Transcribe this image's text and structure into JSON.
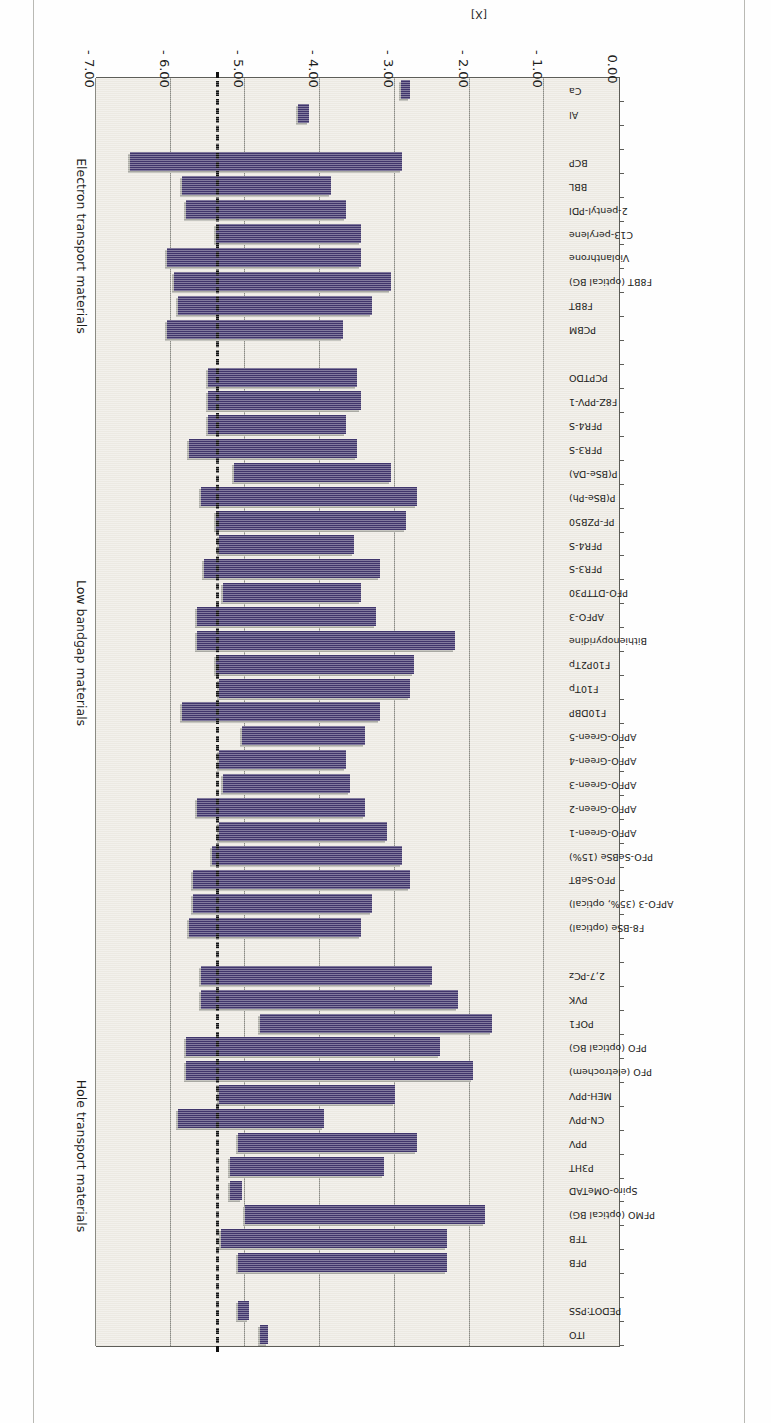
{
  "figure": {
    "axis_title": "[X]",
    "bar_color": "#40356b",
    "shadow_color": "#a9a9a2",
    "plot_background": "#ece9e2",
    "reference_line_value": -5.35,
    "reference_line_color": "#111111"
  },
  "groups": [
    {
      "label": "Hole transport materials"
    },
    {
      "label": "Low bandgap materials"
    },
    {
      "label": "Electron transport materials"
    }
  ],
  "chart_data": {
    "type": "bar",
    "orientation": "horizontal-range",
    "title": "",
    "xlabel": "[X]",
    "ylabel": "",
    "xlim": [
      0.0,
      -7.0
    ],
    "grid": true,
    "legend_position": "none",
    "tick_labels": [
      "0.00",
      "- 1.00",
      "- 2.00",
      "- 3.00",
      "- 4.00",
      "- 5.00",
      "- 6.00",
      "- 7.00"
    ],
    "tick_values": [
      0.0,
      -1.0,
      -2.0,
      -3.0,
      -4.0,
      -5.0,
      -6.0,
      -7.0
    ],
    "annotations": [
      {
        "text": "Hole transport materials",
        "kind": "group-label"
      },
      {
        "text": "Low bandgap materials",
        "kind": "group-label"
      },
      {
        "text": "Electron transport materials",
        "kind": "group-label"
      }
    ],
    "reference_lines": [
      {
        "value": -5.35,
        "style": "dash-dot",
        "color": "#111111"
      }
    ],
    "categories": [
      "ITO",
      "PEDOT:PSS",
      "",
      "PFB",
      "TFB",
      "PFMO (optical BG)",
      "Spiro-OMeTAD",
      "P3HT",
      "PPV",
      "CN-PPV",
      "MEH-PPV",
      "PFO (eletrochem)",
      "PFO (optical BG)",
      "POF1",
      "PVK",
      "2,7-PCz",
      "",
      "F8-BSe (optical)",
      "APFO-3 (35%, optical)",
      "PFO-SeBT",
      "PFO-SeBSe (15%)",
      "APFO-Green-1",
      "APFO-Green-2",
      "APFO-Green-3",
      "APFO-Green-4",
      "APFO-Green-5",
      "F10DBP",
      "F10Tp",
      "F10P2Tp",
      "Bithienopyridine",
      "APFO-3",
      "PFO-DTTP30",
      "PFR3-S",
      "PFR4-S",
      "PF-PZB50",
      "P(BSe-Ph)",
      "P(BSe-DA)",
      "PFR3-S",
      "PFR4-S",
      "F8Z-PPV-1",
      "PCPTDO",
      "",
      "PCBM",
      "F8BT",
      "F8BT (optical BG)",
      "Violanthrone",
      "C13-perylene",
      "2-pentyl-PDI",
      "BBL",
      "BCP",
      "",
      "Al",
      "Ca"
    ],
    "series": [
      {
        "name": "HOMO-LUMO range (eV)",
        "note": "each bar spans from the shallower level (HOMO/LUMO) to the deeper level",
        "ranges": [
          {
            "category": "ITO",
            "start": -4.7,
            "end": -4.8,
            "group": "Hole transport materials"
          },
          {
            "category": "PEDOT:PSS",
            "start": -4.95,
            "end": -5.1,
            "group": "Hole transport materials"
          },
          {
            "category": "PFB",
            "start": -2.3,
            "end": -5.1,
            "group": "Hole transport materials"
          },
          {
            "category": "TFB",
            "start": -2.3,
            "end": -5.33,
            "group": "Hole transport materials"
          },
          {
            "category": "PFMO (optical BG)",
            "start": -1.8,
            "end": -5.0,
            "group": "Hole transport materials"
          },
          {
            "category": "Spiro-OMeTAD",
            "start": -5.05,
            "end": -5.2,
            "group": "Hole transport materials"
          },
          {
            "category": "P3HT",
            "start": -3.15,
            "end": -5.2,
            "group": "Hole transport materials"
          },
          {
            "category": "PPV",
            "start": -2.7,
            "end": -5.1,
            "group": "Hole transport materials"
          },
          {
            "category": "CN-PPV",
            "start": -3.95,
            "end": -5.9,
            "group": "Hole transport materials"
          },
          {
            "category": "MEH-PPV",
            "start": -3.0,
            "end": -5.35,
            "group": "Hole transport materials"
          },
          {
            "category": "PFO (eletrochem)",
            "start": -1.95,
            "end": -5.8,
            "group": "Hole transport materials"
          },
          {
            "category": "PFO (optical BG)",
            "start": -2.4,
            "end": -5.8,
            "group": "Hole transport materials"
          },
          {
            "category": "POF1",
            "start": -1.7,
            "end": -4.8,
            "group": "Hole transport materials"
          },
          {
            "category": "PVK",
            "start": -2.15,
            "end": -5.6,
            "group": "Hole transport materials"
          },
          {
            "category": "2,7-PCz",
            "start": -2.5,
            "end": -5.6,
            "group": "Hole transport materials"
          },
          {
            "category": "F8-BSe (optical)",
            "start": -3.45,
            "end": -5.75,
            "group": "Low bandgap materials"
          },
          {
            "category": "APFO-3 (35%, optical)",
            "start": -3.3,
            "end": -5.7,
            "group": "Low bandgap materials"
          },
          {
            "category": "PFO-SeBT",
            "start": -2.8,
            "end": -5.7,
            "group": "Low bandgap materials"
          },
          {
            "category": "PFO-SeBSe (15%)",
            "start": -2.9,
            "end": -5.45,
            "group": "Low bandgap materials"
          },
          {
            "category": "APFO-Green-1",
            "start": -3.1,
            "end": -5.35,
            "group": "Low bandgap materials"
          },
          {
            "category": "APFO-Green-2",
            "start": -3.4,
            "end": -5.65,
            "group": "Low bandgap materials"
          },
          {
            "category": "APFO-Green-3",
            "start": -3.6,
            "end": -5.3,
            "group": "Low bandgap materials"
          },
          {
            "category": "APFO-Green-4",
            "start": -3.65,
            "end": -5.35,
            "group": "Low bandgap materials"
          },
          {
            "category": "APFO-Green-5",
            "start": -3.4,
            "end": -5.05,
            "group": "Low bandgap materials"
          },
          {
            "category": "F10DBP",
            "start": -3.2,
            "end": -5.85,
            "group": "Low bandgap materials"
          },
          {
            "category": "F10Tp",
            "start": -2.8,
            "end": -5.35,
            "group": "Low bandgap materials"
          },
          {
            "category": "F10P2Tp",
            "start": -2.75,
            "end": -5.4,
            "group": "Low bandgap materials"
          },
          {
            "category": "Bithienopyridine",
            "start": -2.2,
            "end": -5.65,
            "group": "Low bandgap materials"
          },
          {
            "category": "APFO-3",
            "start": -3.25,
            "end": -5.65,
            "group": "Low bandgap materials"
          },
          {
            "category": "PFO-DTTP30",
            "start": -3.45,
            "end": -5.3,
            "group": "Low bandgap materials"
          },
          {
            "category": "PFR3-S",
            "start": -3.2,
            "end": -5.55,
            "group": "Low bandgap materials"
          },
          {
            "category": "PFR4-S",
            "start": -3.55,
            "end": -5.35,
            "group": "Low bandgap materials"
          },
          {
            "category": "PF-PZB50",
            "start": -2.85,
            "end": -5.4,
            "group": "Low bandgap materials"
          },
          {
            "category": "P(BSe-Ph)",
            "start": -2.7,
            "end": -5.6,
            "group": "Low bandgap materials"
          },
          {
            "category": "P(BSe-DA)",
            "start": -3.05,
            "end": -5.15,
            "group": "Low bandgap materials"
          },
          {
            "category": "PFR3-S",
            "start": -3.5,
            "end": -5.75,
            "group": "Low bandgap materials"
          },
          {
            "category": "PFR4-S",
            "start": -3.65,
            "end": -5.5,
            "group": "Low bandgap materials"
          },
          {
            "category": "F8Z-PPV-1",
            "start": -3.45,
            "end": -5.5,
            "group": "Low bandgap materials"
          },
          {
            "category": "PCPTDO",
            "start": -3.5,
            "end": -5.5,
            "group": "Low bandgap materials"
          },
          {
            "category": "PCBM",
            "start": -3.7,
            "end": -6.05,
            "group": "Electron transport materials"
          },
          {
            "category": "F8BT",
            "start": -3.3,
            "end": -5.9,
            "group": "Electron transport materials"
          },
          {
            "category": "F8BT (optical BG)",
            "start": -3.05,
            "end": -5.95,
            "group": "Electron transport materials"
          },
          {
            "category": "Violanthrone",
            "start": -3.45,
            "end": -6.05,
            "group": "Electron transport materials"
          },
          {
            "category": "C13-perylene",
            "start": -3.45,
            "end": -5.4,
            "group": "Electron transport materials"
          },
          {
            "category": "2-pentyl-PDI",
            "start": -3.65,
            "end": -5.8,
            "group": "Electron transport materials"
          },
          {
            "category": "BBL",
            "start": -3.85,
            "end": -5.85,
            "group": "Electron transport materials"
          },
          {
            "category": "BCP",
            "start": -2.9,
            "end": -6.55,
            "group": "Electron transport materials"
          },
          {
            "category": "Al",
            "start": -4.15,
            "end": -4.3,
            "group": "Electron transport materials"
          },
          {
            "category": "Ca",
            "start": -2.8,
            "end": -2.92,
            "group": "Electron transport materials"
          }
        ]
      }
    ]
  }
}
